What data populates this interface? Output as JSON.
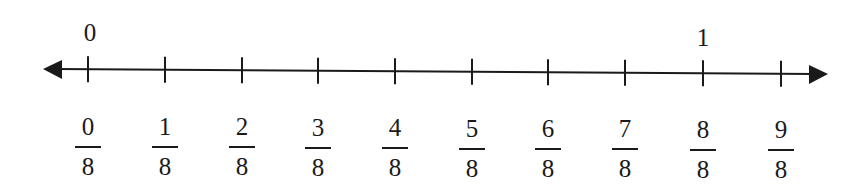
{
  "colors": {
    "line": "#1a1a1a",
    "background": "#ffffff"
  },
  "number_line": {
    "line": {
      "x1": 43,
      "y1": 69,
      "x2": 828,
      "y2": 74
    },
    "ticks": [
      {
        "x": 88,
        "numerator": "0",
        "denominator": "8"
      },
      {
        "x": 165,
        "numerator": "1",
        "denominator": "8"
      },
      {
        "x": 242,
        "numerator": "2",
        "denominator": "8"
      },
      {
        "x": 318,
        "numerator": "3",
        "denominator": "8"
      },
      {
        "x": 395,
        "numerator": "4",
        "denominator": "8"
      },
      {
        "x": 472,
        "numerator": "5",
        "denominator": "8"
      },
      {
        "x": 548,
        "numerator": "6",
        "denominator": "8"
      },
      {
        "x": 625,
        "numerator": "7",
        "denominator": "8"
      },
      {
        "x": 703,
        "numerator": "8",
        "denominator": "8"
      },
      {
        "x": 781,
        "numerator": "9",
        "denominator": "8"
      }
    ],
    "whole_labels": [
      {
        "x": 90,
        "label": "0"
      },
      {
        "x": 703,
        "label": "1"
      }
    ]
  }
}
